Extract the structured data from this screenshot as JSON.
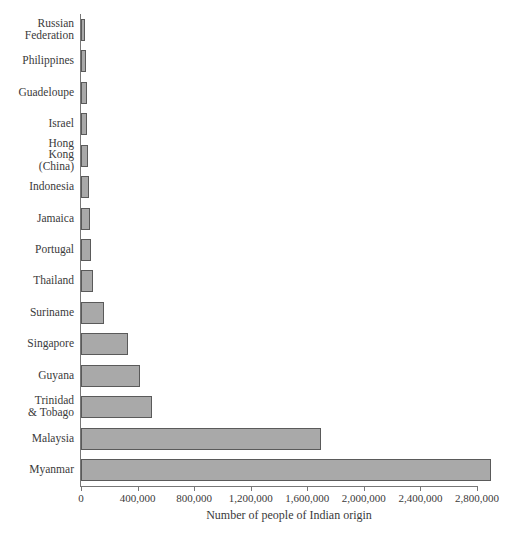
{
  "chart_data": {
    "type": "bar",
    "orientation": "horizontal",
    "title": "",
    "subtitle": "",
    "xlabel": "Number of people of Indian origin",
    "ylabel": "",
    "xlim": [
      0,
      2800000
    ],
    "xticks": [
      0,
      400000,
      800000,
      1200000,
      1600000,
      2000000,
      2400000,
      2800000
    ],
    "xtick_labels": [
      "0",
      "400,000",
      "800,000",
      "1,200,000",
      "1,600,000",
      "2,000,000",
      "2,400,000",
      "2,800,000"
    ],
    "grid": false,
    "legend": null,
    "bar_fill_color": "#a9a9a9",
    "bar_edge_color": "#5a5a5a",
    "axis_color": "#777777",
    "categories": [
      "Russian\nFederation",
      "Philippines",
      "Guadeloupe",
      "Israel",
      "Hong\nKong\n(China)",
      "Indonesia",
      "Jamaica",
      "Portugal",
      "Thailand",
      "Suriname",
      "Singapore",
      "Guyana",
      "Trinidad\n& Tobago",
      "Malaysia",
      "Myanmar"
    ],
    "values": [
      28000,
      38000,
      40000,
      42000,
      48000,
      55000,
      62000,
      70000,
      85000,
      160000,
      330000,
      420000,
      500000,
      1700000,
      2900000
    ]
  }
}
